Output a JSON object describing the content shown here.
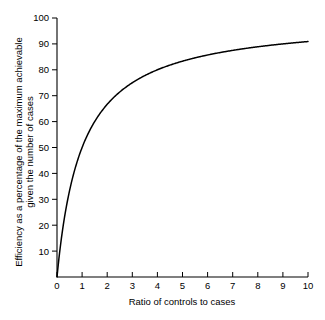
{
  "chart_data": {
    "type": "line",
    "title": "",
    "xlabel": "Ratio of controls to cases",
    "ylabel_line1": "Efficiency as a percentage of the maximum achievable",
    "ylabel_line2": "given the number of cases",
    "xlim": [
      0,
      10
    ],
    "ylim": [
      0,
      100
    ],
    "grid": false,
    "legend": "none",
    "xticks": [
      0,
      1,
      2,
      3,
      4,
      5,
      6,
      7,
      8,
      9,
      10
    ],
    "xtick_labels": [
      "0",
      "1",
      "2",
      "3",
      "4",
      "5",
      "6",
      "7",
      "8",
      "9",
      "10"
    ],
    "yticks": [
      10,
      20,
      30,
      40,
      50,
      60,
      70,
      80,
      90,
      100
    ],
    "ytick_labels": [
      "10",
      "20",
      "30",
      "40",
      "50",
      "60",
      "70",
      "80",
      "90",
      "100"
    ],
    "series": [
      {
        "name": "Efficiency",
        "formula": "100 * r / (r + 1)",
        "x": [
          0,
          0.1,
          0.2,
          0.3,
          0.4,
          0.5,
          0.6,
          0.7,
          0.8,
          0.9,
          1,
          1.25,
          1.5,
          1.75,
          2,
          2.5,
          3,
          3.5,
          4,
          4.5,
          5,
          5.5,
          6,
          6.5,
          7,
          7.5,
          8,
          8.5,
          9,
          9.5,
          10
        ],
        "values": [
          0,
          9.1,
          16.7,
          23.1,
          28.6,
          33.3,
          37.5,
          41.2,
          44.4,
          47.4,
          50,
          55.6,
          60,
          63.6,
          66.7,
          71.4,
          75,
          77.8,
          80,
          81.8,
          83.3,
          84.6,
          85.7,
          86.7,
          87.5,
          88.2,
          88.9,
          89.5,
          90,
          90.5,
          90.9
        ]
      }
    ],
    "colors": {
      "curve": "#000000",
      "axis": "#000000",
      "background": "#ffffff",
      "text": "#000000"
    }
  },
  "figure": {
    "background_label": "white"
  }
}
